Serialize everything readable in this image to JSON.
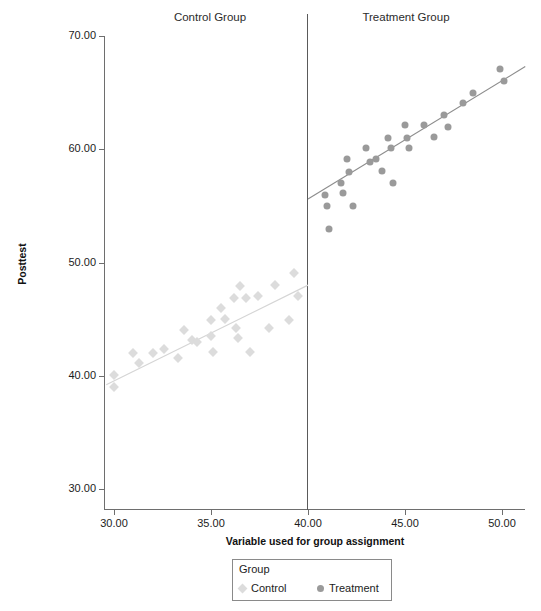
{
  "figure": {
    "faint_top_text": "",
    "panel_headers": {
      "control": "Control Group",
      "treatment": "Treatment Group"
    }
  },
  "legend": {
    "title": "Group",
    "entries": [
      {
        "label": "Control",
        "marker": "diamond",
        "color": "#dcdcdc"
      },
      {
        "label": "Treatment",
        "marker": "circle",
        "color": "#9a9a9a"
      }
    ]
  },
  "chart_data": {
    "type": "scatter",
    "title": "",
    "xlabel": "Variable used for group assignment",
    "ylabel": "Posttest",
    "xlim": [
      28.7,
      51.7
    ],
    "ylim": [
      28.7,
      70.8
    ],
    "xticks": [
      30.0,
      35.0,
      40.0,
      45.0,
      50.0
    ],
    "xtick_labels": [
      "30.00",
      "35.00",
      "40.00",
      "45.00",
      "50.00"
    ],
    "yticks": [
      30.0,
      40.0,
      50.0,
      60.0,
      70.0
    ],
    "ytick_labels": [
      "30.00",
      "40.00",
      "50.00",
      "60.00",
      "70.00"
    ],
    "grid": false,
    "legend_position": "bottom-center",
    "cutoff": {
      "value": 40.0,
      "label": "assignment cutoff",
      "color": "#5a5a5a"
    },
    "panels": [
      {
        "name": "Control Group",
        "x_range": [
          28.7,
          40.0
        ]
      },
      {
        "name": "Treatment Group",
        "x_range": [
          40.0,
          51.7
        ]
      }
    ],
    "series": [
      {
        "name": "Control",
        "marker": "diamond",
        "color": "#dcdcdc",
        "points": [
          [
            30.0,
            40.1
          ],
          [
            30.0,
            39.0
          ],
          [
            31.0,
            42.0
          ],
          [
            31.3,
            41.1
          ],
          [
            32.0,
            42.0
          ],
          [
            32.6,
            42.4
          ],
          [
            33.3,
            41.6
          ],
          [
            33.6,
            44.0
          ],
          [
            34.0,
            43.2
          ],
          [
            34.3,
            43.0
          ],
          [
            35.0,
            44.9
          ],
          [
            35.0,
            43.5
          ],
          [
            35.1,
            42.1
          ],
          [
            35.5,
            46.0
          ],
          [
            35.7,
            45.0
          ],
          [
            36.2,
            46.9
          ],
          [
            36.3,
            44.2
          ],
          [
            36.4,
            43.3
          ],
          [
            36.5,
            47.9
          ],
          [
            36.8,
            46.9
          ],
          [
            37.0,
            42.1
          ],
          [
            37.4,
            47.0
          ],
          [
            38.0,
            44.2
          ],
          [
            38.3,
            48.0
          ],
          [
            39.0,
            44.9
          ],
          [
            39.3,
            49.1
          ],
          [
            39.5,
            47.0
          ]
        ],
        "fit_line": {
          "x0": 29.6,
          "y0": 39.2,
          "x1": 40.0,
          "y1": 48.0
        }
      },
      {
        "name": "Treatment",
        "marker": "circle",
        "color": "#9a9a9a",
        "points": [
          [
            40.9,
            56.0
          ],
          [
            41.0,
            55.0
          ],
          [
            41.1,
            53.0
          ],
          [
            41.7,
            57.0
          ],
          [
            41.8,
            56.1
          ],
          [
            42.0,
            59.1
          ],
          [
            42.1,
            58.0
          ],
          [
            42.3,
            55.0
          ],
          [
            43.0,
            60.1
          ],
          [
            43.2,
            58.9
          ],
          [
            43.5,
            59.1
          ],
          [
            43.8,
            58.1
          ],
          [
            44.1,
            61.0
          ],
          [
            44.3,
            60.1
          ],
          [
            44.4,
            57.0
          ],
          [
            45.0,
            62.1
          ],
          [
            45.1,
            61.0
          ],
          [
            45.2,
            60.1
          ],
          [
            46.0,
            62.1
          ],
          [
            46.5,
            61.1
          ],
          [
            47.0,
            63.0
          ],
          [
            47.2,
            62.0
          ],
          [
            48.0,
            64.1
          ],
          [
            48.5,
            65.0
          ],
          [
            49.9,
            67.1
          ],
          [
            50.1,
            66.0
          ]
        ],
        "fit_line": {
          "x0": 40.0,
          "y0": 55.6,
          "x1": 51.2,
          "y1": 67.3
        }
      }
    ]
  }
}
